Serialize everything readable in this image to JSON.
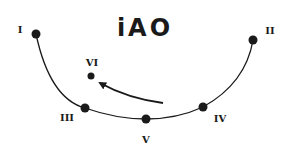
{
  "diagram": {
    "title": "iAO",
    "colors": {
      "ink": "#1a1a1a",
      "background": "#ffffff"
    },
    "points": [
      {
        "id": "I",
        "label": "I",
        "dot": [
          36,
          34
        ],
        "label_pos": [
          20,
          33
        ]
      },
      {
        "id": "II",
        "label": "II",
        "dot": [
          253,
          40
        ],
        "label_pos": [
          270,
          33
        ]
      },
      {
        "id": "VI",
        "label": "VI",
        "dot": [
          91,
          76
        ],
        "label_pos": [
          92,
          65
        ]
      },
      {
        "id": "III",
        "label": "III",
        "dot": [
          85,
          108
        ],
        "label_pos": [
          67,
          121
        ]
      },
      {
        "id": "V",
        "label": "V",
        "dot": [
          146,
          119
        ],
        "label_pos": [
          146,
          142
        ]
      },
      {
        "id": "IV",
        "label": "IV",
        "dot": [
          203,
          107
        ],
        "label_pos": [
          220,
          122
        ]
      }
    ],
    "arc": {
      "description": "curve from I down through III, V, IV up to II"
    },
    "arrow": {
      "description": "curved arrow pointing from near V/IV toward VI",
      "from": [
        163,
        103
      ],
      "to": [
        100,
        83
      ]
    }
  }
}
